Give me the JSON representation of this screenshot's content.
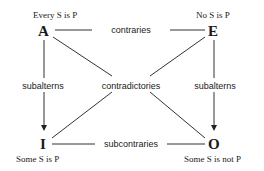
{
  "corners": {
    "A": {
      "letter": "A",
      "proposition": "Every S is P"
    },
    "E": {
      "letter": "E",
      "proposition": "No S is P"
    },
    "I": {
      "letter": "I",
      "proposition": "Some S is P"
    },
    "O": {
      "letter": "O",
      "proposition": "Some S is not P"
    }
  },
  "relations": {
    "top": "contraries",
    "bottom": "subcontraries",
    "left": "subalterns",
    "right": "subalterns",
    "diagonal": "contradictories"
  }
}
